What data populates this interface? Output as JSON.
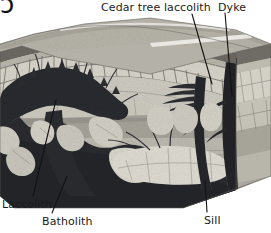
{
  "figure": {
    "type": "geological-block-diagram",
    "palette": {
      "background": "#ffffff",
      "text": "#1b1b1b",
      "leader_line": "#111111",
      "magma_dark": "#2e3034",
      "magma_darkest": "#1d1f22",
      "intrusion_light": "#d9d6cc",
      "strata_light": "#c8c5bb",
      "strata_mid": "#a9a69c",
      "strata_dark": "#7d7a72",
      "topsoil": "#6f6c66",
      "top_surface": "#b5b2a8",
      "side_face": "#9a978d"
    }
  },
  "labels": {
    "cedar_tree_laccolith": "Cedar tree laccolith",
    "dyke": "Dyke",
    "laccolith": "Laccolith",
    "batholith": "Batholith",
    "sill": "Sill"
  },
  "corner_mark": "ɔ",
  "leaders": [
    {
      "name": "leader-cedar-tree-laccolith",
      "from": [
        192,
        14
      ],
      "to": [
        212,
        84
      ]
    },
    {
      "name": "leader-dyke",
      "from": [
        225,
        14
      ],
      "to": [
        232,
        96
      ]
    },
    {
      "name": "leader-laccolith",
      "from": [
        33,
        196
      ],
      "to": [
        55,
        100
      ]
    },
    {
      "name": "leader-batholith",
      "from": [
        52,
        213
      ],
      "to": [
        66,
        178
      ]
    },
    {
      "name": "leader-sill",
      "from": [
        207,
        212
      ],
      "to": [
        205,
        180
      ]
    }
  ],
  "features": [
    {
      "name": "laccolith",
      "description": "Mushroom-shaped intrusion doming the overlying strata on the left"
    },
    {
      "name": "batholith",
      "description": "Large dark magma body at depth feeding the intrusions"
    },
    {
      "name": "cedar-tree-laccolith",
      "description": "Stacked horizontal sheets branching from a vertical feeder"
    },
    {
      "name": "dyke",
      "description": "Vertical discordant sheet cutting across the strata on the right"
    },
    {
      "name": "sill",
      "description": "Concordant horizontal sheet injected between strata at lower right"
    }
  ]
}
